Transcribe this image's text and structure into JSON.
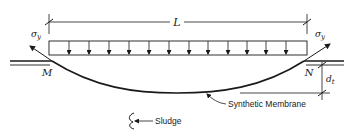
{
  "diagram": {
    "type": "engineering-cross-section",
    "labels": {
      "span": "L",
      "stress_left": "σ",
      "stress_left_sub": "y",
      "stress_right": "σ",
      "stress_right_sub": "y",
      "anchor_left": "M",
      "anchor_right": "N",
      "depth": "d",
      "depth_sub": "t",
      "membrane": "Synthetic Membrane",
      "sludge": "Sludge"
    },
    "load": {
      "kind": "uniform-distributed",
      "arrow_count": 14
    },
    "colors": {
      "ink": "#1a1a1a",
      "background": "#ffffff"
    }
  }
}
